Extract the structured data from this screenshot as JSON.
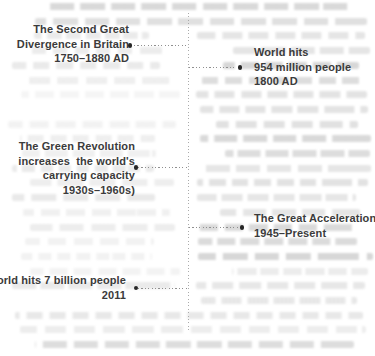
{
  "figure": {
    "type": "timeline-diagram",
    "axis": {
      "orientation": "vertical",
      "style": "dotted"
    },
    "colors": {
      "text": "#3b3b3b",
      "dot": "#262626",
      "connector": "#8f8f8f",
      "axis_line": "#ababab",
      "background": "#ffffff",
      "ghost_text": "#606060"
    },
    "events": [
      {
        "id": "second-great-divergence",
        "side": "left",
        "lines": [
          "The Second Great",
          "Divergence in Britain",
          "1750–1880 AD"
        ]
      },
      {
        "id": "world-hits-954-million",
        "side": "right",
        "lines": [
          "World hits",
          "954 million people",
          "1800 AD"
        ]
      },
      {
        "id": "green-revolution",
        "side": "left",
        "lines": [
          "The Green Revolution",
          "increases  the world's",
          "carrying capacity",
          "1930s–1960s)"
        ]
      },
      {
        "id": "great-acceleration",
        "side": "right",
        "lines": [
          "The Great Acceleration",
          "1945–Present"
        ]
      },
      {
        "id": "world-hits-7-billion",
        "side": "left",
        "lines": [
          "World hits 7 billion people",
          "2011"
        ]
      }
    ]
  }
}
